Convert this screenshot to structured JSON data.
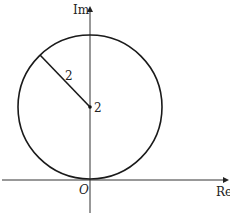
{
  "diagram": {
    "type": "complex-plane-circle",
    "axes": {
      "x_label": "Re",
      "y_label": "Im",
      "origin_label": "O"
    },
    "circle": {
      "center_label": "2",
      "radius_label": "2",
      "center": [
        0,
        2
      ],
      "radius": 2
    },
    "colors": {
      "stroke": "#1a1a1a",
      "axis": "#333333",
      "background": "#ffffff"
    }
  }
}
